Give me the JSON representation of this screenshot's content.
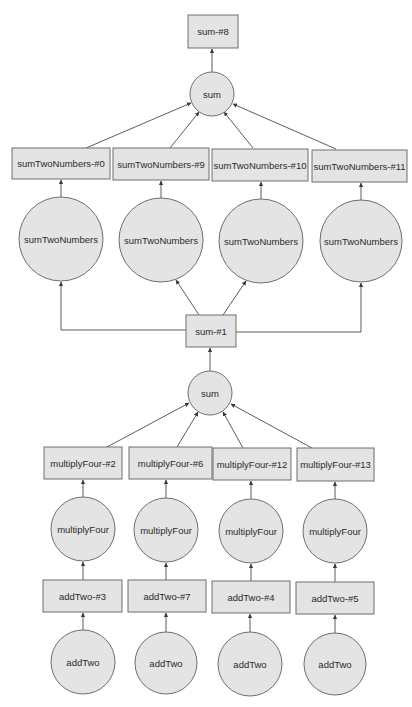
{
  "diagram": {
    "type": "computation-graph",
    "colors": {
      "node_fill": "#e4e4e4",
      "node_stroke": "#6e6e6e",
      "edge": "#4a4a4a",
      "text": "#2a2a2a"
    },
    "nodes": {
      "sum8": {
        "label": "sum-#8",
        "shape": "rect",
        "x": 188,
        "y": 15,
        "w": 50,
        "h": 33
      },
      "opSumTop": {
        "label": "sum",
        "shape": "circle",
        "cx": 212,
        "cy": 94,
        "r": 22
      },
      "stn0": {
        "label": "sumTwoNumbers-#0",
        "shape": "rect",
        "x": 12,
        "y": 148,
        "w": 98,
        "h": 31
      },
      "stn9": {
        "label": "sumTwoNumbers-#9",
        "shape": "rect",
        "x": 113,
        "y": 148,
        "w": 96,
        "h": 32
      },
      "stn10": {
        "label": "sumTwoNumbers-#10",
        "shape": "rect",
        "x": 212,
        "y": 149,
        "w": 96,
        "h": 32
      },
      "stn11": {
        "label": "sumTwoNumbers-#11",
        "shape": "rect",
        "x": 312,
        "y": 150,
        "w": 95,
        "h": 32
      },
      "opStn0": {
        "label": "sumTwoNumbers",
        "shape": "circle",
        "cx": 61,
        "cy": 239,
        "r": 42
      },
      "opStn9": {
        "label": "sumTwoNumbers",
        "shape": "circle",
        "cx": 161,
        "cy": 240,
        "r": 42
      },
      "opStn10": {
        "label": "sumTwoNumbers",
        "shape": "circle",
        "cx": 261,
        "cy": 241,
        "r": 42
      },
      "opStn11": {
        "label": "sumTwoNumbers",
        "shape": "circle",
        "cx": 361,
        "cy": 241,
        "r": 41
      },
      "sum1": {
        "label": "sum-#1",
        "shape": "rect",
        "x": 186,
        "y": 315,
        "w": 50,
        "h": 32
      },
      "opSumMid": {
        "label": "sum",
        "shape": "circle",
        "cx": 210,
        "cy": 393,
        "r": 22
      },
      "mf2": {
        "label": "multiplyFour-#2",
        "shape": "rect",
        "x": 44,
        "y": 447,
        "w": 78,
        "h": 32
      },
      "mf6": {
        "label": "multiplyFour-#6",
        "shape": "rect",
        "x": 129,
        "y": 447,
        "w": 83,
        "h": 32
      },
      "mf12": {
        "label": "multiplyFour-#12",
        "shape": "rect",
        "x": 213,
        "y": 448,
        "w": 78,
        "h": 32
      },
      "mf13": {
        "label": "multiplyFour-#13",
        "shape": "rect",
        "x": 297,
        "y": 448,
        "w": 77,
        "h": 33
      },
      "opMf2": {
        "label": "multiplyFour",
        "shape": "circle",
        "cx": 83,
        "cy": 529,
        "r": 32
      },
      "opMf6": {
        "label": "multiplyFour",
        "shape": "circle",
        "cx": 166,
        "cy": 530,
        "r": 32
      },
      "opMf12": {
        "label": "multiplyFour",
        "shape": "circle",
        "cx": 251,
        "cy": 531,
        "r": 32
      },
      "opMf13": {
        "label": "multiplyFour",
        "shape": "circle",
        "cx": 335,
        "cy": 531,
        "r": 32
      },
      "at3": {
        "label": "addTwo-#3",
        "shape": "rect",
        "x": 43,
        "y": 580,
        "w": 79,
        "h": 32
      },
      "at7": {
        "label": "addTwo-#7",
        "shape": "rect",
        "x": 128,
        "y": 580,
        "w": 78,
        "h": 32
      },
      "at4": {
        "label": "addTwo-#4",
        "shape": "rect",
        "x": 212,
        "y": 581,
        "w": 78,
        "h": 32
      },
      "at5": {
        "label": "addTwo-#5",
        "shape": "rect",
        "x": 296,
        "y": 582,
        "w": 78,
        "h": 32
      },
      "opAt3": {
        "label": "addTwo",
        "shape": "circle",
        "cx": 83,
        "cy": 662,
        "r": 32
      },
      "opAt7": {
        "label": "addTwo",
        "shape": "circle",
        "cx": 166,
        "cy": 663,
        "r": 31
      },
      "opAt4": {
        "label": "addTwo",
        "shape": "circle",
        "cx": 250,
        "cy": 664,
        "r": 32
      },
      "opAt5": {
        "label": "addTwo",
        "shape": "circle",
        "cx": 335,
        "cy": 664,
        "r": 31
      }
    },
    "edges": [
      {
        "from": "opSumTop",
        "to": "sum8",
        "points": [
          [
            212,
            72
          ],
          [
            212,
            49
          ]
        ]
      },
      {
        "from": "stn0",
        "to": "opSumTop",
        "points": [
          [
            86,
            148
          ],
          [
            191,
            103
          ]
        ]
      },
      {
        "from": "stn9",
        "to": "opSumTop",
        "points": [
          [
            170,
            148
          ],
          [
            199,
            112
          ]
        ]
      },
      {
        "from": "stn10",
        "to": "opSumTop",
        "points": [
          [
            253,
            148
          ],
          [
            224,
            112
          ]
        ]
      },
      {
        "from": "stn11",
        "to": "opSumTop",
        "points": [
          [
            336,
            149
          ],
          [
            233,
            104
          ]
        ]
      },
      {
        "from": "opStn0",
        "to": "stn0",
        "points": [
          [
            61,
            197
          ],
          [
            61,
            180
          ]
        ]
      },
      {
        "from": "opStn9",
        "to": "stn9",
        "points": [
          [
            161,
            198
          ],
          [
            161,
            181
          ]
        ]
      },
      {
        "from": "opStn10",
        "to": "stn10",
        "points": [
          [
            261,
            199
          ],
          [
            261,
            182
          ]
        ]
      },
      {
        "from": "opStn11",
        "to": "stn11",
        "points": [
          [
            361,
            200
          ],
          [
            361,
            183
          ]
        ]
      },
      {
        "from": "sum1",
        "to": "opStn0",
        "points": [
          [
            186,
            330
          ],
          [
            61,
            330
          ],
          [
            61,
            282
          ]
        ]
      },
      {
        "from": "sum1",
        "to": "opStn9",
        "points": [
          [
            199,
            315
          ],
          [
            176,
            280
          ]
        ]
      },
      {
        "from": "sum1",
        "to": "opStn10",
        "points": [
          [
            223,
            315
          ],
          [
            246,
            281
          ]
        ]
      },
      {
        "from": "sum1",
        "to": "opStn11",
        "points": [
          [
            236,
            332
          ],
          [
            361,
            332
          ],
          [
            361,
            283
          ]
        ]
      },
      {
        "from": "opSumMid",
        "to": "sum1",
        "points": [
          [
            210,
            371
          ],
          [
            210,
            348
          ]
        ]
      },
      {
        "from": "mf2",
        "to": "opSumMid",
        "points": [
          [
            107,
            447
          ],
          [
            189,
            403
          ]
        ]
      },
      {
        "from": "mf6",
        "to": "opSumMid",
        "points": [
          [
            177,
            447
          ],
          [
            198,
            412
          ]
        ]
      },
      {
        "from": "mf12",
        "to": "opSumMid",
        "points": [
          [
            243,
            448
          ],
          [
            223,
            412
          ]
        ]
      },
      {
        "from": "mf13",
        "to": "opSumMid",
        "points": [
          [
            312,
            448
          ],
          [
            231,
            404
          ]
        ]
      },
      {
        "from": "opMf2",
        "to": "mf2",
        "points": [
          [
            83,
            497
          ],
          [
            83,
            480
          ]
        ]
      },
      {
        "from": "opMf6",
        "to": "mf6",
        "points": [
          [
            166,
            498
          ],
          [
            166,
            480
          ]
        ]
      },
      {
        "from": "opMf12",
        "to": "mf12",
        "points": [
          [
            251,
            499
          ],
          [
            251,
            481
          ]
        ]
      },
      {
        "from": "opMf13",
        "to": "mf13",
        "points": [
          [
            335,
            499
          ],
          [
            335,
            482
          ]
        ]
      },
      {
        "from": "at3",
        "to": "opMf2",
        "points": [
          [
            83,
            580
          ],
          [
            83,
            562
          ]
        ]
      },
      {
        "from": "at7",
        "to": "opMf6",
        "points": [
          [
            166,
            580
          ],
          [
            166,
            563
          ]
        ]
      },
      {
        "from": "at4",
        "to": "opMf12",
        "points": [
          [
            251,
            581
          ],
          [
            251,
            564
          ]
        ]
      },
      {
        "from": "at5",
        "to": "opMf13",
        "points": [
          [
            335,
            582
          ],
          [
            335,
            564
          ]
        ]
      },
      {
        "from": "opAt3",
        "to": "at3",
        "points": [
          [
            83,
            630
          ],
          [
            83,
            613
          ]
        ]
      },
      {
        "from": "opAt7",
        "to": "at7",
        "points": [
          [
            166,
            632
          ],
          [
            166,
            613
          ]
        ]
      },
      {
        "from": "opAt4",
        "to": "at4",
        "points": [
          [
            250,
            632
          ],
          [
            250,
            614
          ]
        ]
      },
      {
        "from": "opAt5",
        "to": "at5",
        "points": [
          [
            335,
            633
          ],
          [
            335,
            615
          ]
        ]
      }
    ]
  }
}
